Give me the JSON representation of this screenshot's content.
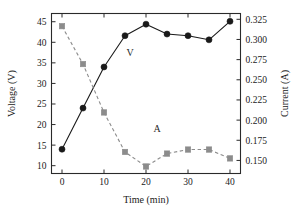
{
  "chart_data": {
    "type": "line",
    "title": "",
    "xlabel": "Time (min)",
    "ylabel": "Voltage (V)",
    "y2label": "Current (A)",
    "x": [
      0,
      5,
      10,
      15,
      20,
      25,
      30,
      35,
      40
    ],
    "xlim": [
      -2.5,
      42.5
    ],
    "xticks": [
      0,
      10,
      20,
      30,
      40
    ],
    "xtick_labels": [
      "0",
      "10",
      "20",
      "30",
      "40"
    ],
    "ylim": [
      8.1,
      47.0
    ],
    "yticks": [
      10,
      15,
      20,
      25,
      30,
      35,
      40,
      45
    ],
    "ytick_labels": [
      "10",
      "15",
      "20",
      "25",
      "30",
      "35",
      "40",
      "45"
    ],
    "y2lim": [
      0.1338,
      0.3322
    ],
    "y2ticks": [
      0.15,
      0.175,
      0.2,
      0.225,
      0.25,
      0.275,
      0.3,
      0.325
    ],
    "y2tick_labels": [
      "0.150",
      "0.175",
      "0.200",
      "0.225",
      "0.250",
      "0.275",
      "0.300",
      "0.325"
    ],
    "grid": false,
    "legend_position": "inline-annotation",
    "series": [
      {
        "name": "V",
        "annotation": "V",
        "axis": "left",
        "marker": "circle",
        "linestyle": "solid",
        "color": "#1a1a1a",
        "values": [
          14.0,
          24.0,
          34.0,
          41.6,
          44.4,
          42.0,
          41.6,
          40.6,
          45.1
        ]
      },
      {
        "name": "A",
        "annotation": "A",
        "axis": "right",
        "marker": "square",
        "linestyle": "dashed",
        "color": "#8c8c8c",
        "values": [
          0.3165,
          0.2695,
          0.2095,
          0.1605,
          0.1425,
          0.1585,
          0.1635,
          0.1635,
          0.1525
        ]
      }
    ]
  },
  "annotations": {
    "voltage_label": "V",
    "current_label": "A"
  },
  "axes": {
    "x_title": "Time (min)",
    "y_left_title": "Voltage (V)",
    "y_right_title": "Current (A)"
  },
  "colors": {
    "voltage_series": "#1a1a1a",
    "current_series": "#8c8c8c",
    "frame": "#2a2a2a",
    "background": "#ffffff"
  }
}
